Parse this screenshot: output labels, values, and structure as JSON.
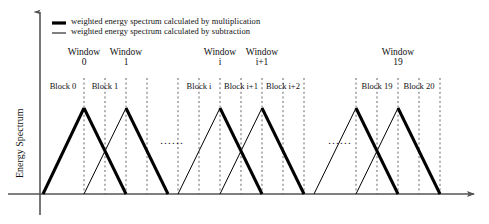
{
  "figure": {
    "axes": {
      "y_axis_label": "Energy Spectrum",
      "x_axis_label": "",
      "y_axis_arrow": "arrow-up-icon",
      "x_axis_arrow": "arrow-right-icon"
    },
    "legend": {
      "entries": [
        {
          "marker": "thick-line-marker",
          "label": "weighted energy spectrum calculated by multiplication",
          "stroke_width": 3.2,
          "color": "#000000"
        },
        {
          "marker": "thin-line-marker",
          "label": "weighted energy spectrum calculated by subtraction",
          "stroke_width": 1.0,
          "color": "#000000"
        }
      ]
    },
    "window_labels": [
      {
        "name": "Window",
        "index": "0",
        "x": 84
      },
      {
        "name": "Window",
        "index": "1",
        "x": 126
      },
      {
        "name": "Window",
        "index": "i",
        "x": 220
      },
      {
        "name": "Window",
        "index": "i+1",
        "x": 262
      },
      {
        "name": "Window",
        "index": "19",
        "x": 398
      }
    ],
    "block_labels": [
      {
        "label": "Block 0",
        "x": 63
      },
      {
        "label": "Block 1",
        "x": 105
      },
      {
        "label": "Block i",
        "x": 199
      },
      {
        "label": "Block i+1",
        "x": 241
      },
      {
        "label": "Block i+2",
        "x": 283
      },
      {
        "label": "Block 19",
        "x": 377
      },
      {
        "label": "Block 20",
        "x": 419
      }
    ],
    "ellipses": [
      {
        "name": "ellipsis-middle-left",
        "text": "......",
        "x": 172,
        "y": 134
      },
      {
        "name": "ellipsis-middle-right",
        "text": "......",
        "x": 340,
        "y": 134
      }
    ],
    "colors": {
      "stroke": "#000000",
      "axis": "#555555",
      "dashed_guide": "#666666",
      "background": "#ffffff"
    },
    "geometry": {
      "baseline_y": 194,
      "peak_y": 108,
      "axis_x": 40,
      "axis_top_y": 12,
      "axis_bottom_y": 215,
      "x_axis_end": 474,
      "dash_top_y": 78,
      "dash_bottom_y": 194,
      "vertical_guides": [
        84,
        105,
        126,
        147,
        178,
        199,
        220,
        241,
        262,
        283,
        304,
        356,
        377,
        398,
        419,
        440
      ],
      "triangles": [
        {
          "name": "triangle-window-0",
          "left": 43,
          "peak": 84,
          "right": 126,
          "rise": "thick",
          "fall": "thick"
        },
        {
          "name": "triangle-window-1",
          "left": 84,
          "peak": 126,
          "right": 168,
          "rise": "thin",
          "fall": "thick"
        },
        {
          "name": "triangle-window-i",
          "left": 178,
          "peak": 220,
          "right": 262,
          "rise": "thin",
          "fall": "thick"
        },
        {
          "name": "triangle-window-i1",
          "left": 220,
          "peak": 262,
          "right": 304,
          "rise": "thin",
          "fall": "thick"
        },
        {
          "name": "triangle-window-18",
          "left": 314,
          "peak": 356,
          "right": 398,
          "rise": "thin",
          "fall": "thick"
        },
        {
          "name": "triangle-window-19",
          "left": 356,
          "peak": 398,
          "right": 440,
          "rise": "thin",
          "fall": "thick"
        }
      ]
    }
  }
}
